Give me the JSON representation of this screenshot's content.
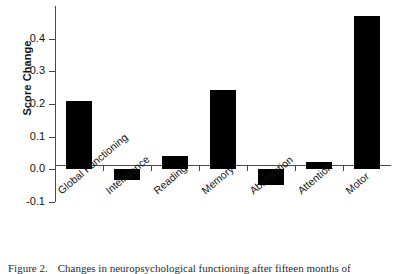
{
  "chart_data": {
    "type": "bar",
    "title": "",
    "xlabel": "",
    "ylabel": "Score Change",
    "categories": [
      "Global Functioning",
      "Intelligence",
      "Reading",
      "Memory",
      "Abstraction",
      "Attention",
      "Motor"
    ],
    "values": [
      0.21,
      -0.033,
      0.042,
      0.243,
      -0.048,
      0.023,
      0.47
    ],
    "ylim": [
      -0.1,
      0.5
    ],
    "yticks": [
      -0.1,
      0.0,
      0.1,
      0.2,
      0.3,
      0.4
    ],
    "ytick_labels": [
      "-0.1",
      "0.0",
      "0.1",
      "0.2",
      "0.3",
      "0.4"
    ],
    "grid": false,
    "legend": null,
    "bar_color": "#000000",
    "axis_color": "#4a4a4a",
    "background": "#ffffff"
  },
  "axis": {
    "y_title": "Score Change"
  },
  "caption": {
    "label": "Figure 2.",
    "text": "Changes in neuropsychological functioning after fifteen months of"
  }
}
